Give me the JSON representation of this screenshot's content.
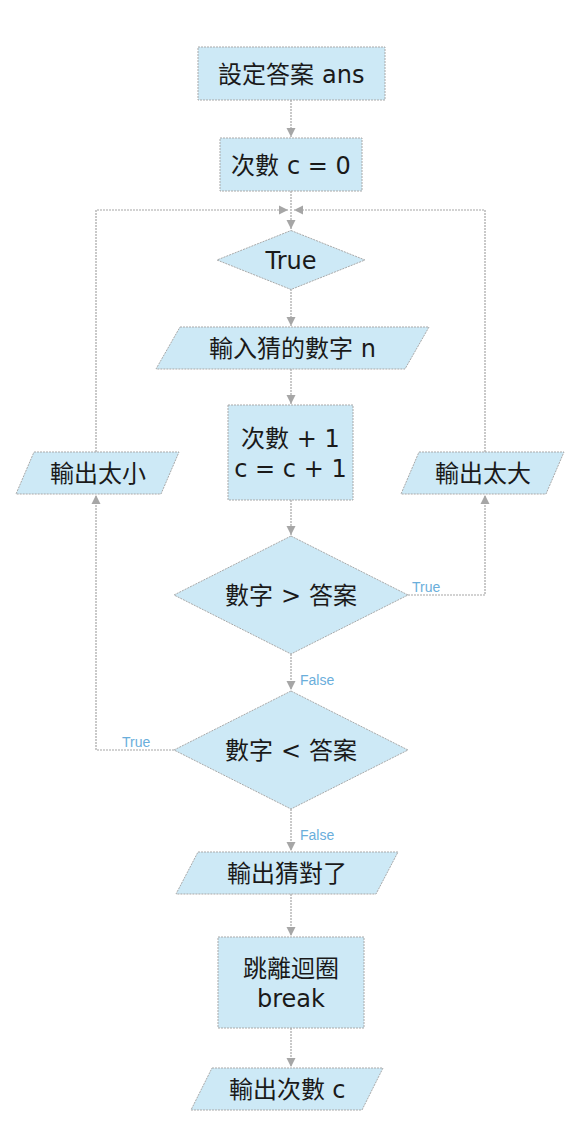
{
  "diagram": {
    "type": "flowchart",
    "colors": {
      "node_fill": "#cde9f6",
      "node_stroke": "#a9a9a9",
      "edge": "#a6a6a6",
      "edge_label": "#6aaedb",
      "text": "#1a1a1a"
    },
    "nodes": [
      {
        "id": "set_answer",
        "shape": "process",
        "lines": [
          "設定答案 ans"
        ],
        "x": 198,
        "y": 47,
        "w": 187,
        "h": 53
      },
      {
        "id": "count_init",
        "shape": "process",
        "lines": [
          "次數 c = 0"
        ],
        "x": 220,
        "y": 138,
        "w": 142,
        "h": 53
      },
      {
        "id": "loop_true",
        "shape": "decision",
        "lines": [
          "True"
        ],
        "cx": 291,
        "cy": 260,
        "w": 148,
        "h": 59
      },
      {
        "id": "input_guess",
        "shape": "io",
        "lines": [
          "輸入猜的數字 n"
        ],
        "x": 156,
        "y": 327,
        "w": 273,
        "h": 42,
        "skew": 24
      },
      {
        "id": "count_inc",
        "shape": "process",
        "lines": [
          "次數 + 1",
          "c = c + 1"
        ],
        "x": 228,
        "y": 405,
        "w": 125,
        "h": 95
      },
      {
        "id": "out_too_small",
        "shape": "io",
        "lines": [
          "輸出太小"
        ],
        "x": 16,
        "y": 452,
        "w": 163,
        "h": 42,
        "skew": 18
      },
      {
        "id": "out_too_big",
        "shape": "io",
        "lines": [
          "輸出太大"
        ],
        "x": 401,
        "y": 452,
        "w": 163,
        "h": 42,
        "skew": 18
      },
      {
        "id": "cmp_greater",
        "shape": "decision",
        "lines": [
          "數字 > 答案"
        ],
        "cx": 291,
        "cy": 595,
        "w": 234,
        "h": 118
      },
      {
        "id": "cmp_less",
        "shape": "decision",
        "lines": [
          "數字 < 答案"
        ],
        "cx": 291,
        "cy": 750,
        "w": 234,
        "h": 118
      },
      {
        "id": "out_correct",
        "shape": "io",
        "lines": [
          "輸出猜對了"
        ],
        "x": 176,
        "y": 852,
        "w": 222,
        "h": 42,
        "skew": 22
      },
      {
        "id": "break_loop",
        "shape": "process",
        "lines": [
          "跳離迴圈",
          "break"
        ],
        "x": 218,
        "y": 937,
        "w": 146,
        "h": 91
      },
      {
        "id": "out_count",
        "shape": "io",
        "lines": [
          "輸出次數 c"
        ],
        "x": 191,
        "y": 1068,
        "w": 192,
        "h": 42,
        "skew": 21
      }
    ],
    "edges": [
      {
        "from": "set_answer",
        "to": "count_init",
        "points": [
          [
            291,
            100
          ],
          [
            291,
            137
          ]
        ],
        "label": ""
      },
      {
        "from": "count_init",
        "to": "loop_true",
        "points": [
          [
            291,
            191
          ],
          [
            291,
            229
          ]
        ],
        "label": ""
      },
      {
        "from": "loop_true",
        "to": "input_guess",
        "points": [
          [
            291,
            289
          ],
          [
            291,
            326
          ]
        ],
        "label": ""
      },
      {
        "from": "input_guess",
        "to": "count_inc",
        "points": [
          [
            291,
            369
          ],
          [
            291,
            404
          ]
        ],
        "label": ""
      },
      {
        "from": "count_inc",
        "to": "cmp_greater",
        "points": [
          [
            291,
            500
          ],
          [
            291,
            535
          ]
        ],
        "label": ""
      },
      {
        "from": "cmp_greater",
        "to": "out_too_big",
        "points": [
          [
            408,
            595
          ],
          [
            485,
            595
          ],
          [
            485,
            495
          ]
        ],
        "label": "True",
        "label_x": 412,
        "label_y": 582
      },
      {
        "from": "out_too_big",
        "to": "loop_true",
        "points": [
          [
            485,
            452
          ],
          [
            485,
            210
          ],
          [
            294,
            210
          ]
        ],
        "label": ""
      },
      {
        "from": "cmp_greater",
        "to": "cmp_less",
        "points": [
          [
            291,
            654
          ],
          [
            291,
            690
          ]
        ],
        "label": "False",
        "label_x": 300,
        "label_y": 675
      },
      {
        "from": "cmp_less",
        "to": "out_too_small",
        "points": [
          [
            174,
            750
          ],
          [
            96,
            750
          ],
          [
            96,
            495
          ]
        ],
        "label": "True",
        "label_x": 122,
        "label_y": 737
      },
      {
        "from": "out_too_small",
        "to": "loop_true",
        "points": [
          [
            96,
            452
          ],
          [
            96,
            210
          ],
          [
            288,
            210
          ]
        ],
        "label": ""
      },
      {
        "from": "cmp_less",
        "to": "out_correct",
        "points": [
          [
            291,
            809
          ],
          [
            291,
            851
          ]
        ],
        "label": "False",
        "label_x": 300,
        "label_y": 830
      },
      {
        "from": "out_correct",
        "to": "break_loop",
        "points": [
          [
            291,
            894
          ],
          [
            291,
            936
          ]
        ],
        "label": ""
      },
      {
        "from": "break_loop",
        "to": "out_count",
        "points": [
          [
            291,
            1028
          ],
          [
            291,
            1067
          ]
        ],
        "label": ""
      }
    ]
  }
}
